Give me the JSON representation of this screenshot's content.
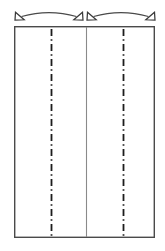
{
  "canvas": {
    "width": 165,
    "height": 251,
    "background_color": "#ffffff",
    "title": "Folded panel section diagram"
  },
  "styles": {
    "outline_color": "#4a4a4a",
    "outline_width": 1.4,
    "centerline_color": "#1c1c1c",
    "centerline_width": 1.8,
    "thin_line_color": "#8a8a8a",
    "thin_line_width": 1.1,
    "arc_color": "#4a4a4a",
    "arc_width": 1.2,
    "arrow_fill": "#ffffff",
    "arrow_stroke": "#3a3a3a"
  },
  "panel": {
    "name": "main-rectangle",
    "x": 14,
    "y": 26,
    "width": 141,
    "height": 212
  },
  "center_lines": [
    {
      "name": "left-fold-centerline",
      "x": 51,
      "y_start": 29,
      "y_end": 236,
      "pattern": "dash-dot"
    },
    {
      "name": "right-fold-centerline",
      "x": 123,
      "y_start": 29,
      "y_end": 236,
      "pattern": "dash-dot"
    }
  ],
  "divider_lines": [
    {
      "name": "center-seam-line",
      "x": 86,
      "y_start": 27,
      "y_end": 237,
      "pattern": "solid"
    }
  ],
  "arcs": [
    {
      "name": "left-fold-arrow-arc",
      "x_start": 17,
      "x_end": 81,
      "y_base": 18,
      "apex_y": 10,
      "arrowhead_start": "open-triangle",
      "arrowhead_end": "open-triangle"
    },
    {
      "name": "right-fold-arrow-arc",
      "x_start": 89,
      "x_end": 153,
      "y_base": 18,
      "apex_y": 10,
      "arrowhead_start": "open-triangle",
      "arrowhead_end": "open-triangle"
    }
  ],
  "arrowheads": [
    {
      "name": "arrowhead-left-outer",
      "x": 17,
      "y": 18,
      "direction": "down-left"
    },
    {
      "name": "arrowhead-left-inner",
      "x": 81,
      "y": 18,
      "direction": "down-right"
    },
    {
      "name": "arrowhead-right-inner",
      "x": 89,
      "y": 18,
      "direction": "down-left"
    },
    {
      "name": "arrowhead-right-outer",
      "x": 153,
      "y": 18,
      "direction": "down-right"
    }
  ],
  "labels": []
}
